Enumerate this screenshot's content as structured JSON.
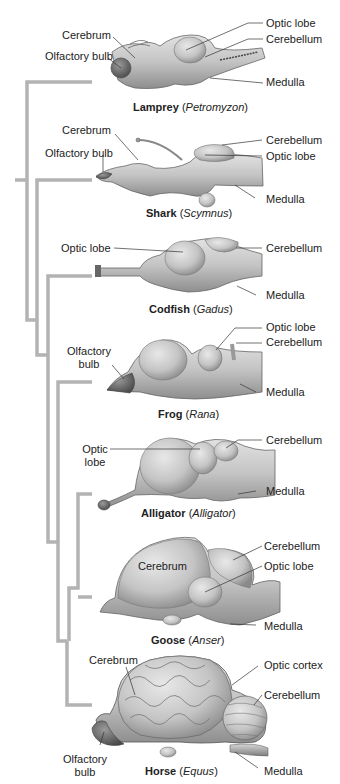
{
  "diagram": {
    "type": "cladogram of vertebrate brains",
    "tree_color": "#b3b3b3",
    "brain_fill": "#c9c9c9",
    "brain_shade": "#9a9a9a",
    "specimens": [
      {
        "common": "Lamprey",
        "genus": "Petromyzon",
        "labels": [
          "Cerebrum",
          "Olfactory bulb",
          "Optic lobe",
          "Cerebellum",
          "Medulla"
        ]
      },
      {
        "common": "Shark",
        "genus": "Scymnus",
        "labels": [
          "Cerebrum",
          "Olfactory bulb",
          "Cerebellum",
          "Optic lobe",
          "Medulla"
        ]
      },
      {
        "common": "Codfish",
        "genus": "Gadus",
        "labels": [
          "Optic lobe",
          "Cerebellum",
          "Medulla"
        ]
      },
      {
        "common": "Frog",
        "genus": "Rana",
        "labels": [
          "Olfactory",
          "bulb",
          "Optic lobe",
          "Cerebellum",
          "Medulla"
        ]
      },
      {
        "common": "Alligator",
        "genus": "Alligator",
        "labels": [
          "Optic",
          "lobe",
          "Cerebellum",
          "Medulla"
        ]
      },
      {
        "common": "Goose",
        "genus": "Anser",
        "labels": [
          "Cerebrum",
          "Cerebellum",
          "Optic lobe",
          "Medulla"
        ]
      },
      {
        "common": "Horse",
        "genus": "Equus",
        "labels": [
          "Cerebrum",
          "Optic cortex",
          "Cerebellum",
          "Olfactory",
          "bulb",
          "Medulla"
        ]
      }
    ]
  }
}
